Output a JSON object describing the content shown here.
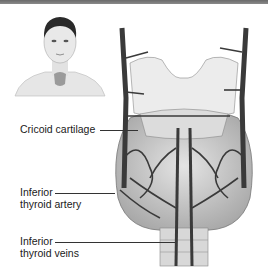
{
  "figure": {
    "thumbnail": "front-view-person-neck-thyroid",
    "main_illustration": "thyroid-gland-anterior-view-with-larynx-and-vessels"
  },
  "labels": [
    {
      "id": "cricoid",
      "lines": [
        "Cricoid cartilage"
      ]
    },
    {
      "id": "artery",
      "lines": [
        "Inferior",
        "thyroid artery"
      ]
    },
    {
      "id": "veins",
      "lines": [
        "Inferior",
        "thyroid veins"
      ]
    }
  ],
  "colors": {
    "topbar": "#777777",
    "vessel": "#3a3a3a",
    "tissue": "#cfcfcf",
    "cartilage": "#e8e8e8",
    "text": "#1a1a1a"
  }
}
